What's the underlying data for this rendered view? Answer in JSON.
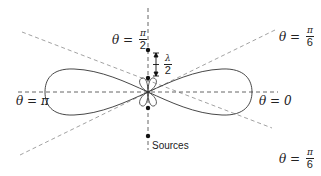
{
  "diagram": {
    "labels": {
      "theta_half_pi": {
        "lhs": "θ =",
        "num": "π",
        "den": "2"
      },
      "theta_sixth_pi_top": {
        "lhs": "θ =",
        "num": "π",
        "den": "6"
      },
      "theta_sixth_pi_bottom": {
        "lhs": "θ =",
        "num": "π",
        "den": "6"
      },
      "theta_pi": "θ = π",
      "theta_zero": "θ = 0",
      "sources": "Sources",
      "spacing": {
        "prefix": "f",
        "num": "λ",
        "den": "2"
      }
    },
    "colors": {
      "curve": "#333333",
      "dashed_axis": "#555555",
      "dashed_diagonal": "#888888",
      "source_dot": "#111111",
      "text": "#222222"
    },
    "sources_count": 4
  }
}
